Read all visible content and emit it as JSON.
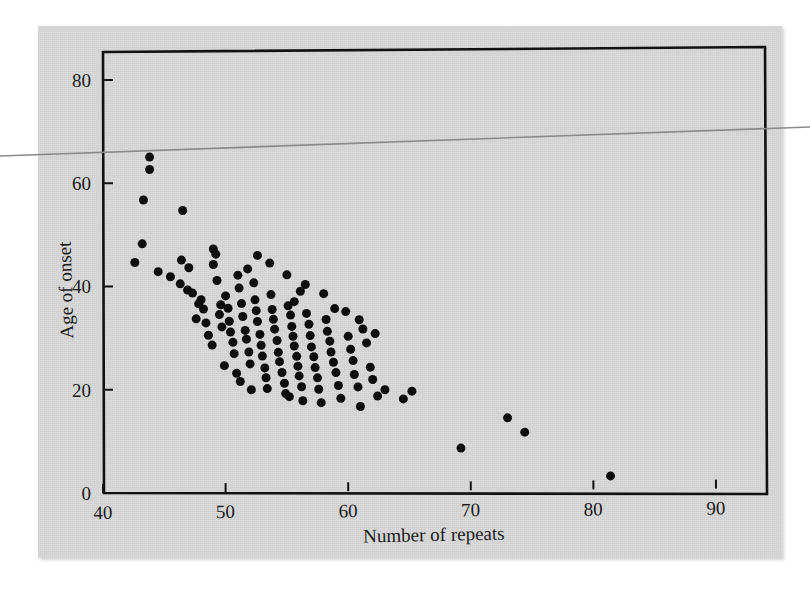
{
  "figure": {
    "background_color": "#d9d9d9",
    "page_color": "#ffffff",
    "ink_color": "#111111",
    "artifact": {
      "name": "scan-line-artifact",
      "color": "#8a8a8a",
      "left_y": 156,
      "right_y": 127
    }
  },
  "chart_data": {
    "type": "scatter",
    "title": "",
    "xlabel": "Number of repeats",
    "ylabel": "Age of onset",
    "xlim": [
      40,
      94
    ],
    "ylim": [
      0,
      86
    ],
    "xticks": [
      40,
      50,
      60,
      70,
      80,
      90
    ],
    "xtick_labels": [
      "40",
      "50",
      "60",
      "70",
      "80",
      "90"
    ],
    "yticks": [
      0,
      20,
      40,
      60,
      80
    ],
    "ytick_labels": [
      "0",
      "20",
      "40",
      "60",
      "80"
    ],
    "grid": false,
    "legend": null,
    "marker": "filled-circle",
    "marker_color": "#0d0d0d",
    "marker_size_px": 9,
    "n_points": 123,
    "points": [
      [
        43.8,
        65.0
      ],
      [
        43.8,
        62.6
      ],
      [
        43.3,
        56.7
      ],
      [
        46.5,
        54.6
      ],
      [
        42.6,
        44.6
      ],
      [
        43.2,
        48.2
      ],
      [
        44.5,
        42.8
      ],
      [
        45.5,
        41.8
      ],
      [
        46.4,
        45.0
      ],
      [
        46.3,
        40.4
      ],
      [
        47.0,
        43.5
      ],
      [
        47.3,
        38.6
      ],
      [
        48.0,
        37.3
      ],
      [
        48.2,
        35.5
      ],
      [
        48.6,
        30.4
      ],
      [
        49.0,
        47.1
      ],
      [
        49.2,
        46.1
      ],
      [
        49.0,
        44.1
      ],
      [
        49.3,
        41.0
      ],
      [
        49.6,
        36.3
      ],
      [
        49.5,
        34.4
      ],
      [
        49.7,
        32.0
      ],
      [
        50.0,
        38.0
      ],
      [
        50.2,
        35.6
      ],
      [
        50.3,
        33.1
      ],
      [
        50.4,
        31.0
      ],
      [
        50.6,
        29.0
      ],
      [
        50.7,
        26.8
      ],
      [
        51.0,
        42.0
      ],
      [
        51.1,
        39.5
      ],
      [
        51.3,
        36.5
      ],
      [
        51.4,
        34.0
      ],
      [
        51.6,
        31.3
      ],
      [
        51.7,
        29.6
      ],
      [
        51.9,
        27.1
      ],
      [
        52.0,
        24.8
      ],
      [
        52.3,
        40.5
      ],
      [
        52.4,
        37.2
      ],
      [
        52.5,
        35.1
      ],
      [
        52.6,
        33.0
      ],
      [
        52.8,
        30.5
      ],
      [
        52.9,
        28.4
      ],
      [
        53.0,
        26.3
      ],
      [
        53.2,
        24.0
      ],
      [
        53.3,
        22.1
      ],
      [
        53.6,
        44.3
      ],
      [
        53.7,
        38.2
      ],
      [
        53.8,
        35.3
      ],
      [
        53.9,
        33.4
      ],
      [
        54.0,
        31.5
      ],
      [
        54.2,
        29.3
      ],
      [
        54.3,
        27.0
      ],
      [
        54.4,
        25.2
      ],
      [
        54.6,
        23.1
      ],
      [
        54.8,
        21.0
      ],
      [
        55.0,
        42.0
      ],
      [
        55.1,
        36.0
      ],
      [
        55.3,
        34.2
      ],
      [
        55.4,
        32.0
      ],
      [
        55.5,
        30.1
      ],
      [
        55.6,
        28.2
      ],
      [
        55.8,
        26.2
      ],
      [
        55.9,
        24.3
      ],
      [
        56.0,
        22.4
      ],
      [
        56.2,
        20.3
      ],
      [
        56.3,
        17.6
      ],
      [
        56.5,
        40.1
      ],
      [
        56.6,
        34.5
      ],
      [
        56.8,
        32.4
      ],
      [
        56.9,
        30.2
      ],
      [
        57.0,
        28.0
      ],
      [
        57.2,
        26.1
      ],
      [
        57.3,
        24.0
      ],
      [
        57.5,
        22.0
      ],
      [
        57.6,
        19.8
      ],
      [
        58.0,
        38.3
      ],
      [
        58.2,
        33.3
      ],
      [
        58.3,
        31.0
      ],
      [
        58.5,
        29.1
      ],
      [
        58.6,
        27.0
      ],
      [
        58.8,
        25.0
      ],
      [
        59.0,
        23.0
      ],
      [
        59.2,
        20.5
      ],
      [
        59.4,
        18.0
      ],
      [
        59.8,
        34.8
      ],
      [
        60.0,
        30.0
      ],
      [
        60.2,
        27.5
      ],
      [
        60.4,
        25.3
      ],
      [
        60.5,
        22.6
      ],
      [
        60.8,
        20.2
      ],
      [
        61.0,
        16.4
      ],
      [
        61.5,
        28.7
      ],
      [
        61.8,
        24.0
      ],
      [
        62.0,
        21.6
      ],
      [
        62.4,
        18.4
      ],
      [
        63.0,
        19.6
      ],
      [
        64.5,
        17.8
      ],
      [
        65.2,
        19.3
      ],
      [
        69.2,
        8.2
      ],
      [
        73.0,
        14.0
      ],
      [
        74.4,
        11.2
      ],
      [
        81.4,
        2.6
      ],
      [
        47.6,
        33.6
      ],
      [
        48.9,
        28.5
      ],
      [
        50.9,
        23.0
      ],
      [
        51.2,
        21.4
      ],
      [
        52.1,
        19.8
      ],
      [
        53.4,
        20.0
      ],
      [
        54.9,
        19.0
      ],
      [
        55.2,
        18.4
      ],
      [
        57.8,
        17.2
      ],
      [
        49.9,
        24.5
      ],
      [
        48.4,
        32.8
      ],
      [
        47.8,
        36.5
      ],
      [
        46.9,
        39.2
      ],
      [
        52.6,
        45.8
      ],
      [
        51.8,
        43.2
      ],
      [
        55.6,
        36.8
      ],
      [
        56.1,
        38.8
      ],
      [
        58.9,
        35.4
      ],
      [
        60.9,
        33.2
      ],
      [
        62.2,
        30.5
      ],
      [
        61.2,
        31.4
      ]
    ]
  },
  "axes": {
    "x_axis_name": "Number of repeats",
    "y_axis_name": "Age of onset"
  }
}
